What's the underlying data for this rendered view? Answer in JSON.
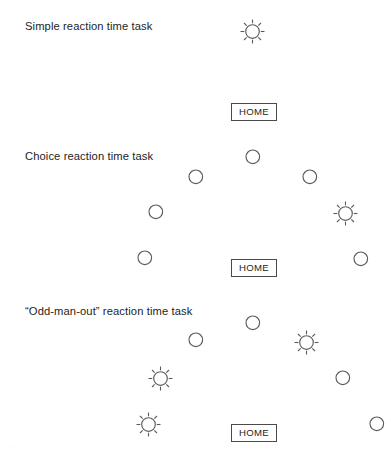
{
  "figure": {
    "width": 391,
    "height": 454,
    "background": "#ffffff",
    "stroke_color": "#5b5b5b",
    "text_color": "#1d1d1d",
    "circle_radius": 6.8,
    "sun_core_radius": 6.8,
    "sun_ray_outer": 12,
    "sun_ray_count": 8,
    "faint_bottom_artifact": "..."
  },
  "sections": [
    {
      "id": "simple-reaction-time-task",
      "label": "Simple reaction time task",
      "label_x": 25,
      "label_y": 20,
      "home": {
        "label": "HOME",
        "x": 231,
        "y": 103,
        "width": 46,
        "height": 18
      },
      "targets": [
        {
          "kind": "sun",
          "x": 252,
          "y": 31
        }
      ]
    },
    {
      "id": "choice-reaction-time-task",
      "label": "Choice reaction time task",
      "label_x": 25,
      "label_y": 150,
      "home": {
        "label": "HOME",
        "x": 231,
        "y": 259,
        "width": 46,
        "height": 18
      },
      "targets": [
        {
          "kind": "circle",
          "x": 253,
          "y": 157
        },
        {
          "kind": "circle",
          "x": 196,
          "y": 177
        },
        {
          "kind": "circle",
          "x": 310,
          "y": 177
        },
        {
          "kind": "circle",
          "x": 156,
          "y": 212
        },
        {
          "kind": "sun",
          "x": 345,
          "y": 213
        },
        {
          "kind": "circle",
          "x": 145,
          "y": 258
        },
        {
          "kind": "circle",
          "x": 361,
          "y": 259
        }
      ]
    },
    {
      "id": "odd-man-out-reaction-time-task",
      "label": "“Odd-man-out” reaction time task",
      "label_x": 25,
      "label_y": 305,
      "home": {
        "label": "HOME",
        "x": 231,
        "y": 424,
        "width": 46,
        "height": 18
      },
      "targets": [
        {
          "kind": "circle",
          "x": 253,
          "y": 323
        },
        {
          "kind": "circle",
          "x": 196,
          "y": 340
        },
        {
          "kind": "sun",
          "x": 306,
          "y": 342
        },
        {
          "kind": "sun",
          "x": 160,
          "y": 378
        },
        {
          "kind": "circle",
          "x": 343,
          "y": 378
        },
        {
          "kind": "sun",
          "x": 148,
          "y": 424
        },
        {
          "kind": "circle",
          "x": 377,
          "y": 424
        }
      ]
    }
  ]
}
